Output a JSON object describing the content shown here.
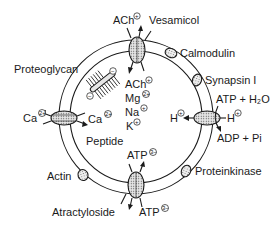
{
  "diagram": {
    "membrane": {
      "center": [
        136,
        117
      ],
      "outer_radius": 77,
      "inner_radius": 66
    },
    "interior_contents": [
      "ACh",
      "Mg",
      "Na",
      "K",
      "Peptide"
    ],
    "interior_charges": {
      "ACh": "+",
      "Mg": "2+",
      "Na": "+",
      "K": "+"
    },
    "transporters": {
      "top": {
        "label_outside": "ACh",
        "charge": "+",
        "inhibitor": "Vesamicol"
      },
      "left": {
        "label_outside": "Ca",
        "label_inside": "Ca",
        "charge": "2+"
      },
      "right": {
        "label_inside": "H",
        "label_outside": "H",
        "charge": "+",
        "substrate": "ATP + H2O",
        "product": "ADP + Pi"
      },
      "bottom": {
        "label_inside": "ATP",
        "label_outside": "ATP",
        "charge": "3-",
        "inhibitor": "Atractyloside"
      }
    },
    "peripheral_proteins": [
      "Calmodulin",
      "Synapsin I",
      "Proteinkinase",
      "Actin"
    ],
    "proteoglycan": {
      "label": "Proteoglycan",
      "charges": [
        "−",
        "−"
      ]
    }
  },
  "labels": {
    "vesamicol": "Vesamicol",
    "ach_out": "ACh",
    "ach_out_chg": "+",
    "calmodulin": "Calmodulin",
    "synapsin": "Synapsin I",
    "atp_h2o": "ATP + H₂O",
    "proteoglycan": "Proteoglycan",
    "ca_out": "Ca",
    "ca_out_chg": "2+",
    "ca_in": "Ca",
    "ca_in_chg": "2+",
    "ach_in": "ACh",
    "ach_in_chg": "+",
    "mg": "Mg",
    "mg_chg": "2+",
    "na": "Na",
    "na_chg": "+",
    "k": "K",
    "k_chg": "+",
    "peptide": "Peptide",
    "h_in": "H",
    "h_in_chg": "+",
    "h_out": "H",
    "h_out_chg": "+",
    "adp_pi": "ADP + Pi",
    "actin": "Actin",
    "proteinkinase": "Proteinkinase",
    "atp_in": "ATP",
    "atp_in_chg": "3−",
    "atractyloside": "Atractyloside",
    "atp_out": "ATP",
    "atp_out_chg": "3−",
    "neg1": "−",
    "neg2": "−"
  }
}
